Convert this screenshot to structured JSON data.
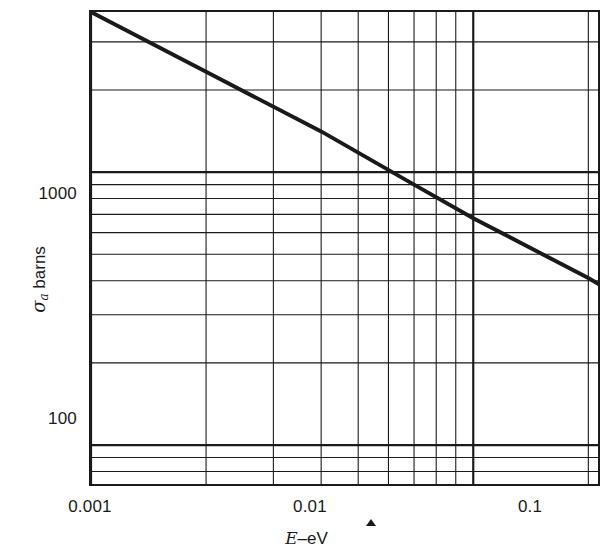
{
  "figure": {
    "background_color": "#ffffff",
    "ink_color": "#1a1a1a"
  },
  "axes": {
    "x": {
      "title_parts": {
        "symbol": "E",
        "dash": "–",
        "unit": "eV"
      },
      "title": "E – eV",
      "scale": "log",
      "major_ticks": [
        "0.001",
        "0.01",
        "0.1"
      ],
      "major_tick_values": [
        0.001,
        0.01,
        0.1
      ],
      "limits": [
        0.001,
        0.0212
      ],
      "minor_multipliers": [
        2,
        3,
        4,
        5,
        6,
        7,
        8,
        9
      ]
    },
    "y": {
      "title_parts": {
        "symbol": "σ",
        "subscript": "a",
        "unit": "barns"
      },
      "title": "σa barns",
      "scale": "log",
      "major_ticks": [
        "100",
        "1000"
      ],
      "major_tick_values": [
        100,
        1000
      ],
      "limits": [
        72,
        3860
      ],
      "minor_multipliers": [
        2,
        3,
        4,
        5,
        6,
        7,
        8,
        9
      ]
    }
  },
  "chart_data": {
    "type": "line",
    "title": "",
    "subtitle": "",
    "xlabel": "E – eV",
    "ylabel": "σa barns",
    "xscale": "log",
    "yscale": "log",
    "xlim": [
      0.001,
      0.0212
    ],
    "ylim": [
      72,
      3860
    ],
    "xticks": [
      0.001,
      0.01,
      0.1
    ],
    "xticklabels": [
      "0.001",
      "0.01",
      "0.1"
    ],
    "yticks": [
      100,
      1000
    ],
    "yticklabels": [
      "100",
      "1000"
    ],
    "grid": true,
    "grid_style": "log-log minor and major rules, both axes",
    "legend": null,
    "legend_position": "none",
    "annotations": [
      {
        "text": "small filled triangle marker below axis",
        "x_px": 371,
        "y_px": 522
      }
    ],
    "series": [
      {
        "name": "absorption cross section",
        "line_color": "#1a1a1a",
        "line_width_px": 4,
        "marker": "none",
        "x": [
          0.001,
          0.002,
          0.004,
          0.007,
          0.01,
          0.02,
          0.0212
        ],
        "y": [
          3860,
          2330,
          1410,
          900,
          678,
          409,
          390
        ],
        "log_slope": -0.733,
        "endpoints": {
          "start": [
            0.001,
            3860
          ],
          "end": [
            0.0212,
            390
          ]
        }
      }
    ]
  }
}
